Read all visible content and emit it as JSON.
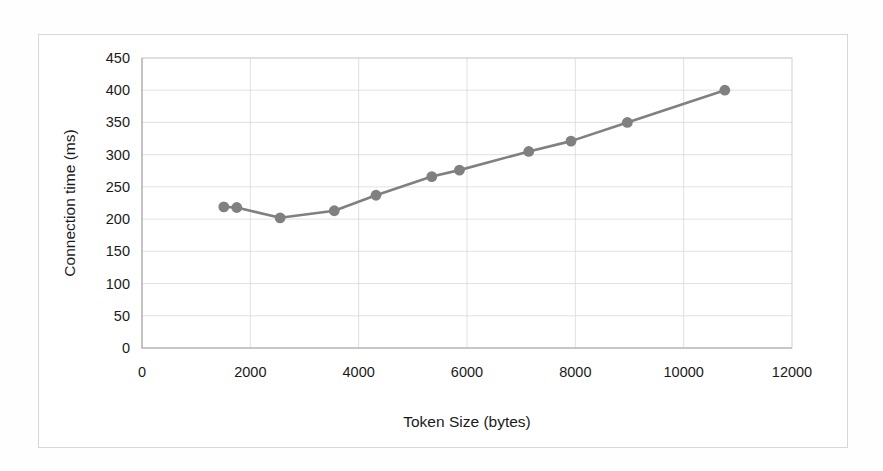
{
  "chart_data": {
    "type": "line",
    "title": "",
    "xlabel": "Token Size (bytes)",
    "ylabel": "Connection time (ms)",
    "xlim": [
      0,
      12000
    ],
    "ylim": [
      0,
      450
    ],
    "xticks": [
      0,
      2000,
      4000,
      6000,
      8000,
      10000,
      12000
    ],
    "yticks": [
      0,
      50,
      100,
      150,
      200,
      250,
      300,
      350,
      400,
      450
    ],
    "xtick_labels": [
      "0",
      "2000",
      "4000",
      "6000",
      "8000",
      "10000",
      "12000"
    ],
    "ytick_labels": [
      "0",
      "50",
      "100",
      "150",
      "200",
      "250",
      "300",
      "350",
      "400",
      "450"
    ],
    "grid": "horizontal-and-vertical",
    "legend": "none",
    "series": [
      {
        "name": "Connection time",
        "color": "#808080",
        "marker": "circle",
        "x": [
          1510,
          1750,
          2550,
          3550,
          4320,
          5350,
          5860,
          7140,
          7920,
          8960,
          10760
        ],
        "y": [
          219,
          218,
          202,
          213,
          237,
          266,
          276,
          305,
          321,
          350,
          400
        ]
      }
    ]
  },
  "style": {
    "series_color": "#808080",
    "grid_color": "#d9d9d9",
    "text_color": "#1a1a1a",
    "frame_color": "#d7d7d7",
    "background": "#ffffff"
  }
}
